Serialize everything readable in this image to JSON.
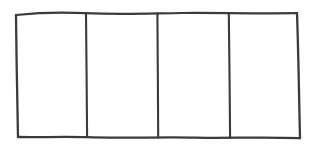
{
  "canvas": {
    "width": 314,
    "height": 150,
    "background_color": "#ffffff"
  },
  "drawing": {
    "title": "",
    "style": "hand-drawn pencil sketch",
    "stroke_color": "#3b3b3b",
    "stroke_width": 2.2,
    "fill_color": "none",
    "shape": "rectangle-divided-into-four-cells",
    "cell_count": 4,
    "outer_rect": {
      "top_left": [
        16,
        14
      ],
      "top_right": [
        297,
        13
      ],
      "bottom_right": [
        300,
        138
      ],
      "bottom_left": [
        18,
        137
      ]
    },
    "paths": {
      "top_edge": "M16,15 C40,12.5 62,12 86,13.2 C120,14.6 150,13.4 182,13.0 C215,12.7 250,13.6 297,13.2",
      "right_edge": "M297,13.2 C298.2,45 299.0,92 300,138.2",
      "bottom_edge": "M300,138.2 C262,136.6 228,138.4 196,137.6 C160,136.7 120,138.6 87,137.2 C62,136.3 36,137.6 18,137.0",
      "left_edge": "M18,137.0 C17.2,100 16.4,55 16,15",
      "divider_1": "M86,13.4 C86.4,50 86.8,100 87.1,137.3",
      "divider_2": "M157.4,13.3 C157.7,50 158.0,100 158.2,137.6",
      "divider_3": "M228.8,13.1 C229.3,50 229.8,100 230.1,138.0"
    },
    "cells": [
      {
        "index": 1,
        "label": "",
        "x_range": [
          16,
          86
        ]
      },
      {
        "index": 2,
        "label": "",
        "x_range": [
          86,
          157
        ]
      },
      {
        "index": 3,
        "label": "",
        "x_range": [
          157,
          229
        ]
      },
      {
        "index": 4,
        "label": "",
        "x_range": [
          229,
          300
        ]
      }
    ]
  }
}
